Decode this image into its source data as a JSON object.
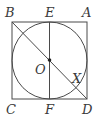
{
  "diagram": {
    "colors": {
      "stroke": "#4a4a4a",
      "text": "#3a3a3a",
      "background": "#ffffff"
    },
    "labels": {
      "A": "A",
      "B": "B",
      "C": "C",
      "D": "D",
      "E": "E",
      "F": "F",
      "O": "O",
      "X": "X"
    },
    "shapes": {
      "square": [
        "B",
        "A",
        "D",
        "C"
      ],
      "circle": {
        "center": "O",
        "inscribed_in": "square"
      },
      "segments": [
        [
          "E",
          "F"
        ],
        [
          "B",
          "D"
        ]
      ],
      "points": [
        "O"
      ]
    }
  }
}
